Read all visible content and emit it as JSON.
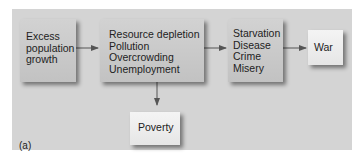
{
  "diagram": {
    "nodes": [
      {
        "id": "excess",
        "lines": [
          "Excess",
          "population",
          "growth"
        ]
      },
      {
        "id": "resource",
        "lines": [
          "Resource depletion",
          "Pollution",
          "Overcrowding",
          "Unemployment"
        ]
      },
      {
        "id": "starvation",
        "lines": [
          "Starvation",
          "Disease",
          "Crime",
          "Misery"
        ]
      },
      {
        "id": "war",
        "lines": [
          "War"
        ]
      },
      {
        "id": "poverty",
        "lines": [
          "Poverty"
        ]
      }
    ],
    "edges": [
      {
        "from": "excess",
        "to": "resource"
      },
      {
        "from": "resource",
        "to": "starvation"
      },
      {
        "from": "starvation",
        "to": "war"
      },
      {
        "from": "resource",
        "to": "poverty"
      }
    ],
    "panel_label": "(a)"
  },
  "colors": {
    "panel_bg": "#d4d4d4",
    "box_dark": "#c8c8c8",
    "box_light": "#eeeeee",
    "arrow": "#555555"
  }
}
